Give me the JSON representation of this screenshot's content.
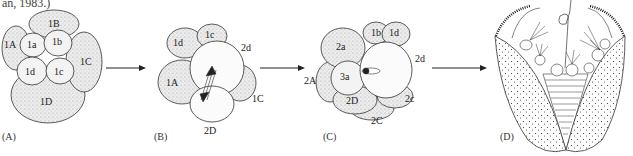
{
  "caption_fragment": "an, 1983.)",
  "panels": [
    {
      "id": "A",
      "label": "(A)",
      "cells": [
        "1B",
        "1A",
        "1a",
        "1b",
        "1C",
        "1d",
        "1c",
        "1D"
      ]
    },
    {
      "id": "B",
      "label": "(B)",
      "cells": [
        "1d",
        "1c",
        "2d",
        "1A",
        "1C",
        "2D"
      ]
    },
    {
      "id": "C",
      "label": "(C)",
      "cells": [
        "2a",
        "1b",
        "1d",
        "2d",
        "2A",
        "3a",
        "2D",
        "2c",
        "2C"
      ]
    },
    {
      "id": "D",
      "label": "(D)",
      "cells": []
    }
  ]
}
